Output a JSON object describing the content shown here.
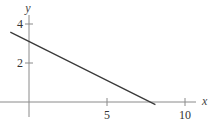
{
  "chart_data": {
    "type": "line",
    "title": "",
    "xlabel": "x",
    "ylabel": "y",
    "xlim": [
      -1.2,
      10.6
    ],
    "ylim": [
      -0.6,
      4.3
    ],
    "x_ticks": [
      5,
      10
    ],
    "x_tick_labels": [
      "5",
      "10"
    ],
    "y_ticks": [
      2,
      4
    ],
    "y_tick_labels": [
      "2",
      "4"
    ],
    "grid": false,
    "series": [
      {
        "name": "line",
        "x": [
          -1.2,
          8.1
        ],
        "y": [
          3.58,
          -0.14
        ]
      }
    ]
  }
}
